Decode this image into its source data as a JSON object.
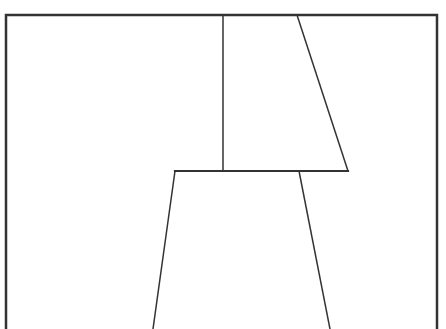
{
  "diagram": {
    "width": 446,
    "height": 329,
    "background": "#ffffff",
    "stroke_color": "#333333",
    "frame": {
      "x1": 6,
      "y1": 15,
      "x2": 437,
      "y2": 329,
      "stroke_width": 2.5
    },
    "lines": [
      {
        "id": "upper-vertical",
        "x1": 223,
        "y1": 15,
        "x2": 223,
        "y2": 171,
        "stroke_width": 1.5
      },
      {
        "id": "upper-slant",
        "x1": 297,
        "y1": 15,
        "x2": 348,
        "y2": 171,
        "stroke_width": 1.5
      },
      {
        "id": "middle-horizontal",
        "x1": 175,
        "y1": 171,
        "x2": 348,
        "y2": 171,
        "stroke_width": 2.2
      },
      {
        "id": "lower-left-slant",
        "x1": 175,
        "y1": 171,
        "x2": 153,
        "y2": 329,
        "stroke_width": 1.5
      },
      {
        "id": "lower-right-slant",
        "x1": 299,
        "y1": 171,
        "x2": 330,
        "y2": 329,
        "stroke_width": 1.5
      }
    ]
  }
}
